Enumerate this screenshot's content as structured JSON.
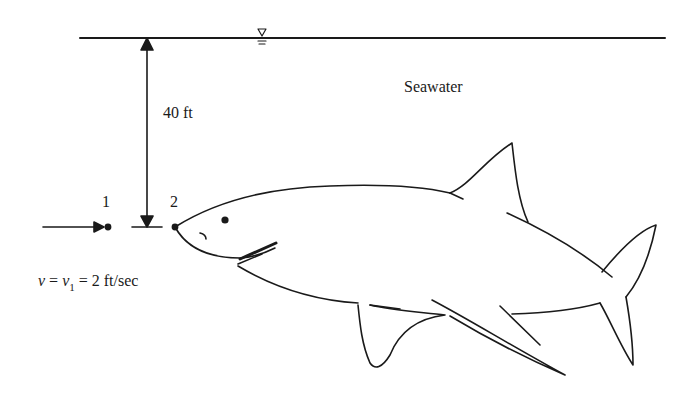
{
  "labels": {
    "medium": "Seawater",
    "depth": "40 ft",
    "point1": "1",
    "point2": "2",
    "velocity": {
      "symbol": "v",
      "eq1": " = ",
      "symbol2": "v",
      "subscript": "1",
      "eq2": " = 2 ft/sec"
    }
  },
  "icons": {
    "free_surface": "water-surface-symbol",
    "flow_arrow": "arrow-right",
    "depth_arrow": "double-headed-vertical-arrow",
    "subject": "shark-outline"
  },
  "colors": {
    "line": "#1a1a1a",
    "background": "#ffffff"
  }
}
